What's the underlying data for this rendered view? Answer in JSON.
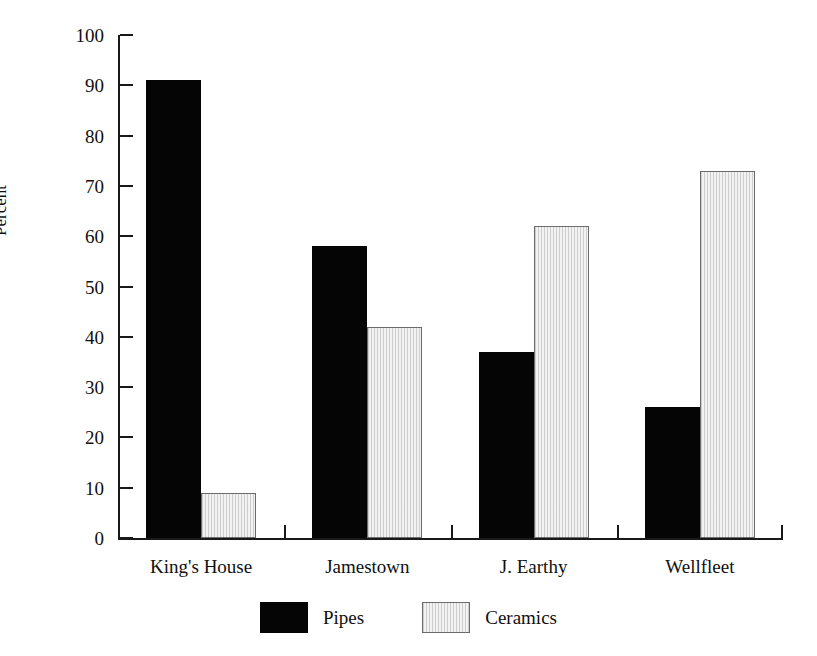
{
  "chart_data": {
    "type": "bar",
    "title": "",
    "xlabel": "",
    "ylabel": "Percent",
    "ylim": [
      0,
      100
    ],
    "ytick_step": 10,
    "yticks": [
      0,
      10,
      20,
      30,
      40,
      50,
      60,
      70,
      80,
      90,
      100
    ],
    "ytick_labels": [
      "0",
      "10",
      "20",
      "30",
      "40",
      "50",
      "60",
      "70",
      "80",
      "90",
      "100"
    ],
    "categories": [
      "King's House",
      "Jamestown",
      "J. Earthy",
      "Wellfleet"
    ],
    "series": [
      {
        "name": "Pipes",
        "color": "#050505",
        "values": [
          91,
          58,
          37,
          26
        ]
      },
      {
        "name": "Ceramics",
        "color": "#f2f2f2",
        "values": [
          9,
          42,
          62,
          73
        ]
      }
    ],
    "grid": false,
    "legend_position": "bottom",
    "legend_entries": [
      "Pipes",
      "Ceramics"
    ]
  },
  "legend": {
    "items": [
      {
        "label": "Pipes",
        "swatch": "black-filled-swatch"
      },
      {
        "label": "Ceramics",
        "swatch": "light-hatched-swatch"
      }
    ]
  },
  "axes": {
    "y_axis_label": "Percent"
  }
}
